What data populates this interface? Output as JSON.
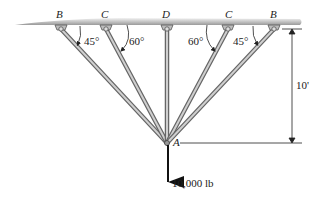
{
  "diagram": {
    "supports": [
      {
        "label": "B",
        "x": 61,
        "angle": "45°"
      },
      {
        "label": "C",
        "x": 106,
        "angle": "60°"
      },
      {
        "label": "D",
        "x": 167,
        "angle": ""
      },
      {
        "label": "C",
        "x": 228,
        "angle": "60°"
      },
      {
        "label": "B",
        "x": 274,
        "angle": "45°"
      }
    ],
    "joint": {
      "label": "A"
    },
    "dimension": {
      "label": "10'"
    },
    "load": {
      "label": "10,000 lb"
    },
    "colors": {
      "ceiling_light": "#e6e6e6",
      "ceiling_dark": "#9a9a9a",
      "member": "#8c8c8c",
      "line": "#222222"
    }
  }
}
